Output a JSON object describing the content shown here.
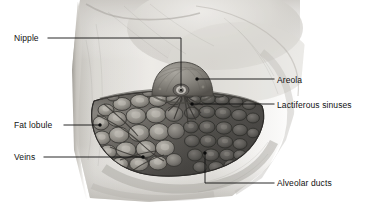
{
  "figure": {
    "background_color": "#ffffff",
    "line_color": "#111111",
    "width": 371,
    "height": 205
  },
  "labels": {
    "nipple": "Nipple",
    "fat_lobule": "Fat lobule",
    "veins": "Veins",
    "areola": "Areola",
    "lactiferous_sinuses": "Lactiferous sinuses",
    "alveolar_ducts": "Alveolar ducts"
  },
  "leaders": [
    {
      "name": "nipple",
      "label": "Nipple",
      "label_side": "left",
      "path": "M 48 38 L 181 38 L 181 89",
      "endpoint": {
        "x": 181,
        "y": 90
      },
      "has_dot": true
    },
    {
      "name": "fat-lobule",
      "label": "Fat lobule",
      "label_side": "left",
      "path": "M 64 125 L 100 125",
      "endpoint": {
        "x": 100,
        "y": 125
      },
      "has_dot": true
    },
    {
      "name": "veins",
      "label": "Veins",
      "label_side": "left",
      "path": "M 44 157 L 143 157",
      "endpoint": {
        "x": 143,
        "y": 157
      },
      "has_dot": true
    },
    {
      "name": "areola",
      "label": "Areola",
      "label_side": "right",
      "path": "M 272 79 L 197 79",
      "endpoint": {
        "x": 197,
        "y": 79
      },
      "has_dot": true
    },
    {
      "name": "lactiferous-sinuses",
      "label": "Lactiferous sinuses",
      "label_side": "right",
      "path": "M 272 104 L 192 104",
      "endpoint": {
        "x": 192,
        "y": 104
      },
      "has_dot": true
    },
    {
      "name": "alveolar-ducts",
      "label": "Alveolar ducts",
      "label_side": "right",
      "path": "M 272 183 L 205 183 L 205 153",
      "endpoint": {
        "x": 205,
        "y": 152
      },
      "has_dot": true
    }
  ],
  "anatomy": {
    "torso": {
      "name": "torso-skin",
      "description": "Shaded chest wall and upper arm region in grayscale graphite rendering",
      "tone_light": "#f2f1ee",
      "tone_mid": "#cfcdc8",
      "tone_dark": "#a3a09a"
    },
    "breast_tissue": {
      "name": "breast-gland-mass",
      "description": "Fan-shaped sectioned mammary gland mass showing lobules",
      "tone_light": "#9b9892",
      "tone_mid": "#6f6c67",
      "tone_dark": "#4a4845"
    },
    "areola_dome": {
      "name": "areola-dome",
      "description": "Raised pigmented circular areola with central nipple",
      "tone_mid": "#8c8981",
      "tone_dark": "#5e5b55"
    },
    "nipple": {
      "name": "nipple-tip",
      "description": "Central nipple opening",
      "tone_dark": "#2b2a28",
      "tone_highlight": "#dedcd6"
    },
    "fat_lobules": {
      "name": "fat-lobule-cells",
      "description": "Left portion polygonal pale fat lobules with visible veins",
      "count_visible": 46
    },
    "alveolar_region": {
      "name": "alveolar-duct-cluster",
      "description": "Right portion darker dense clustered alveolar ducts",
      "count_visible": 38
    }
  }
}
